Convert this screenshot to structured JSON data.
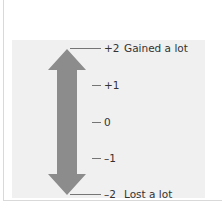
{
  "diagram": {
    "type": "bipolar-rating-scale",
    "arrow_color": "#8c8c8c",
    "panel_color": "#f0f0f0",
    "tick_color": "#555555",
    "text_color": "#333333",
    "ticks": [
      {
        "value": "+2",
        "description": "Gained a lot"
      },
      {
        "value": "+1",
        "description": ""
      },
      {
        "value": "0",
        "description": ""
      },
      {
        "value": "–1",
        "description": ""
      },
      {
        "value": "–2",
        "description": "Lost a lot"
      }
    ]
  }
}
